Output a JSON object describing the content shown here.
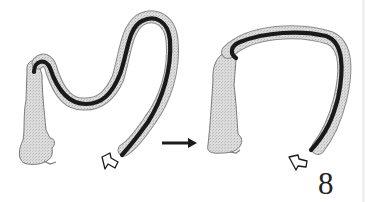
{
  "diagram": {
    "figure_number": "8",
    "panels": [
      {
        "id": "before",
        "description": "Colonoscope forming an N-loop in the sigmoid colon"
      },
      {
        "id": "after",
        "description": "Colonoscope straightened, colon shortened"
      }
    ],
    "transition_arrow": "right-arrow",
    "insertion_arrows": [
      "hollow-arrow-up-right",
      "hollow-arrow-up-right"
    ],
    "colors": {
      "colon_fill": "#d4d4d4",
      "colon_outline": "#8a8a8a",
      "scope": "#1a1a1a",
      "text": "#222222",
      "background": "#ffffff"
    }
  }
}
